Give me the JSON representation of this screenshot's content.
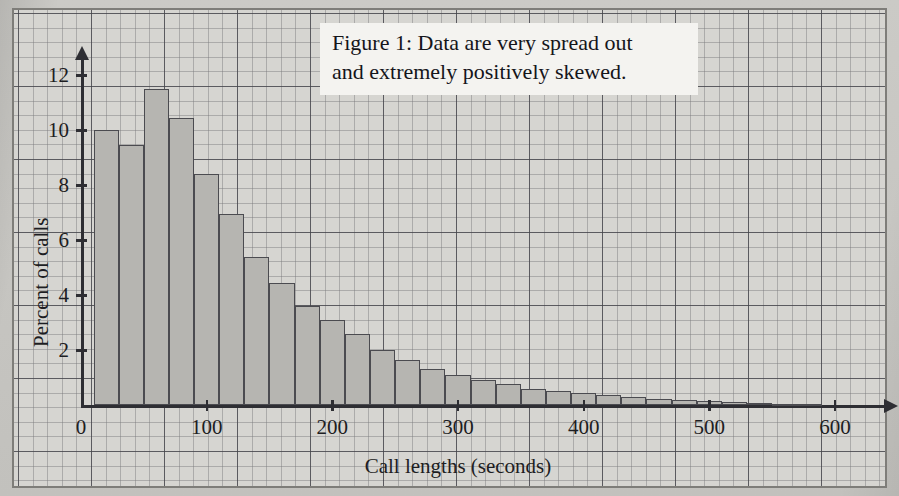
{
  "figure": {
    "caption_line_1": "Figure 1: Data are very spread out",
    "caption_line_2": "and extremely positively skewed."
  },
  "colors": {
    "bar_fill": "#b6b5b1",
    "bar_stroke": "#4b4b50",
    "axis": "#2e2e33",
    "grid_minor": "#5a5a5f",
    "grid_major": "#37373e",
    "paper": "#d6d5d1",
    "caption_bg": "#f4f3f0"
  },
  "chart_data": {
    "type": "bar",
    "title": "",
    "subtitle": "",
    "xlabel": "Call lengths (seconds)",
    "ylabel": "Percent of calls",
    "xlim": [
      0,
      640
    ],
    "ylim": [
      0,
      12.6
    ],
    "grid": true,
    "legend": null,
    "x_ticks": [
      0,
      100,
      200,
      300,
      400,
      500,
      600
    ],
    "x_tick_labels": [
      "0",
      "100",
      "200",
      "300",
      "400",
      "500",
      "600"
    ],
    "y_ticks": [
      2,
      4,
      6,
      8,
      10,
      12
    ],
    "y_tick_labels": [
      "2",
      "4",
      "6",
      "8",
      "10",
      "12"
    ],
    "bin_width": 20,
    "bin_start": 10,
    "bin_edges": [
      10,
      30,
      50,
      70,
      90,
      110,
      130,
      150,
      170,
      190,
      210,
      230,
      250,
      270,
      290,
      310,
      330,
      350,
      370,
      390,
      410,
      430,
      450,
      470,
      490,
      510,
      530,
      550,
      570,
      590
    ],
    "categories": [
      "10-30",
      "30-50",
      "50-70",
      "70-90",
      "90-110",
      "110-130",
      "130-150",
      "150-170",
      "170-190",
      "190-210",
      "210-230",
      "230-250",
      "250-270",
      "270-290",
      "290-310",
      "310-330",
      "330-350",
      "350-370",
      "370-390",
      "390-410",
      "410-430",
      "430-450",
      "450-470",
      "470-490",
      "490-510",
      "510-530",
      "530-550",
      "550-570",
      "570-590"
    ],
    "values": [
      10.0,
      9.45,
      11.5,
      10.45,
      8.4,
      6.95,
      5.4,
      4.45,
      3.6,
      3.1,
      2.6,
      2.0,
      1.65,
      1.3,
      1.1,
      0.9,
      0.75,
      0.6,
      0.5,
      0.42,
      0.35,
      0.28,
      0.22,
      0.17,
      0.13,
      0.1,
      0.07,
      0.05,
      0.03
    ],
    "annotations": [
      {
        "text": "Figure 1: Data are very spread out and extremely positively skewed.",
        "x": 230,
        "y": 11.6
      }
    ]
  },
  "axis_geometry": {
    "origin_x_px": 81,
    "origin_y_px": 405,
    "px_per_x_unit": 1.2566,
    "px_per_y_unit": 27.5
  }
}
